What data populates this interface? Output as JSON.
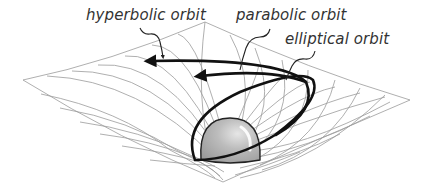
{
  "diagram": {
    "type": "orbit-types-on-curved-spacetime",
    "labels": {
      "hyperbolic": "hyperbolic orbit",
      "parabolic": "parabolic orbit",
      "elliptical": "elliptical orbit"
    },
    "colors": {
      "grid": "#9a9a9a",
      "orbit": "#111111",
      "mass": "#b8b8b8",
      "mass_outline": "#222222",
      "text": "#333333",
      "background": "#ffffff"
    },
    "elements": [
      {
        "name": "spacetime-grid",
        "description": "curved mesh funnel (gravity well)"
      },
      {
        "name": "central-mass",
        "description": "gray sphere sitting in the well"
      },
      {
        "name": "elliptical-orbit",
        "description": "closed ellipse around the mass"
      },
      {
        "name": "parabolic-orbit",
        "description": "open curve with arrowhead"
      },
      {
        "name": "hyperbolic-orbit",
        "description": "open curve with arrowhead"
      }
    ]
  }
}
